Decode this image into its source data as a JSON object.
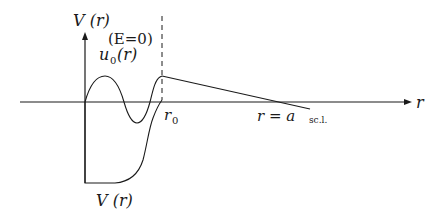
{
  "diagram": {
    "labels": {
      "y_axis_top": "V (r)",
      "energy": "(E=0)",
      "wavefunction": "u",
      "wavefunction_sub": "0",
      "wavefunction_arg": "(r)",
      "r0": "r",
      "r0_sub": "0",
      "x_axis": "r",
      "a_label": "r = a",
      "a_sub": "sc.l.",
      "potential_bottom": "V (r)"
    },
    "colors": {
      "stroke": "#1a1a1a",
      "background": "#ffffff"
    }
  }
}
